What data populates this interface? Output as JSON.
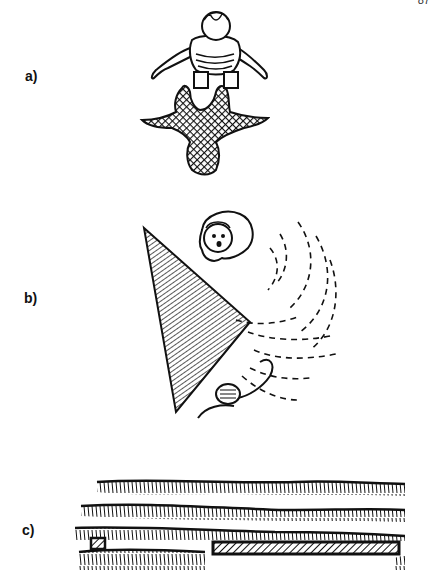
{
  "page": {
    "number": "87",
    "background": "#ffffff",
    "ink": "#111111"
  },
  "panels": [
    {
      "label": "a)",
      "description": "Person seen from above leaning forward over a hatched shadow"
    },
    {
      "label": "b)",
      "description": "Two people separated by a hatched triangular wall with dashed sound waves curving around it"
    },
    {
      "label": "c)",
      "description": "Rows of vegetation seen from a distance with a small hatched box and a long hatched bar"
    }
  ]
}
